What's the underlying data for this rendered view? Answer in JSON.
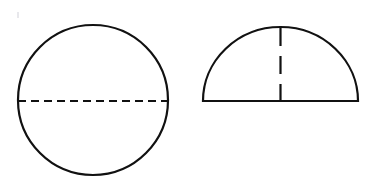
{
  "figure": {
    "background_color": "#ffffff",
    "stroke_color": "#111111",
    "stroke_width": 2.2,
    "canvas": {
      "width": 366,
      "height": 183
    },
    "caption": "",
    "shapes": [
      {
        "id": "circle",
        "name": "circle-shape",
        "label": "Circle with dashed diameter",
        "type": "circle",
        "center": {
          "x": 93,
          "y": 100
        },
        "radius": 75,
        "bounds": {
          "x_min": 18,
          "x_max": 168,
          "y_min": 25,
          "y_max": 175
        },
        "outline_style": "solid",
        "fill": "none",
        "marker": {
          "id": "circle-diameter",
          "name": "circle-diameter-dashed-line",
          "label": "Dashed horizontal diameter",
          "type": "line",
          "orientation": "horizontal",
          "style": "dashed",
          "dash_pattern": "8 5",
          "from": {
            "x": 18,
            "y": 101
          },
          "to": {
            "x": 168,
            "y": 101
          }
        }
      },
      {
        "id": "semicircle",
        "name": "semicircle-shape",
        "label": "Semicircle with dashed radius",
        "type": "semicircle",
        "center": {
          "x": 280.5,
          "y": 101
        },
        "radius": 77.5,
        "height": 74,
        "bounds": {
          "x_min": 203,
          "x_max": 358,
          "y_min": 27,
          "y_max": 101
        },
        "baseline": {
          "from": {
            "x": 203,
            "y": 101
          },
          "to": {
            "x": 358,
            "y": 101
          }
        },
        "outline_style": "solid",
        "fill": "none",
        "marker": {
          "id": "semicircle-radius",
          "name": "semicircle-radius-dashed-line",
          "label": "Dashed vertical radius",
          "type": "line",
          "orientation": "vertical",
          "style": "dashed",
          "dash_pattern": "18 10",
          "from": {
            "x": 280.5,
            "y": 28
          },
          "to": {
            "x": 280.5,
            "y": 101
          }
        }
      }
    ],
    "artifacts": [
      {
        "id": "scan-speck",
        "name": "scan-speck-artifact",
        "label": "Faint scan speck",
        "x": 17,
        "y": 12,
        "width": 2,
        "height": 6,
        "color": "#e8e8ec"
      }
    ]
  }
}
